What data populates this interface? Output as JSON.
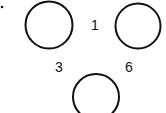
{
  "diagram": {
    "labels": {
      "top": "1",
      "left": "3",
      "right": "6"
    },
    "circles": [
      {
        "name": "circle-top-left",
        "cx": 49,
        "cy": 25,
        "r": 24
      },
      {
        "name": "circle-top-right",
        "cx": 138,
        "cy": 26,
        "r": 23
      },
      {
        "name": "circle-bottom",
        "cx": 96,
        "cy": 97,
        "r": 23
      }
    ],
    "stroke_color": "#111111"
  }
}
